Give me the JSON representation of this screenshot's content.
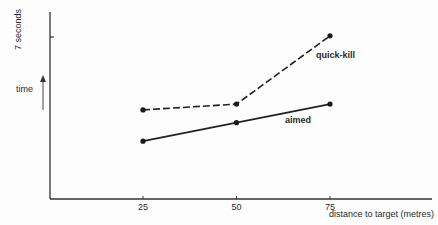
{
  "chart_data": {
    "type": "line",
    "title": "",
    "xlabel": "distance to target (metres)",
    "ylabel": "time",
    "y_tick_label": "7 seconds",
    "categories": [
      25,
      50,
      75
    ],
    "x_tick_labels": [
      "25",
      "50",
      "75"
    ],
    "ylim": [
      0,
      7.5
    ],
    "y_ticks": [
      7
    ],
    "grid": false,
    "legend": "inline labels",
    "series": [
      {
        "name": "quick-kill",
        "style": "dashed",
        "values": [
          3.85,
          4.1,
          7.05
        ]
      },
      {
        "name": "aimed",
        "style": "solid",
        "values": [
          2.5,
          3.3,
          4.1
        ]
      }
    ]
  },
  "colors": {
    "ink": "#2a2a2a",
    "background": "#fdfdfd"
  }
}
